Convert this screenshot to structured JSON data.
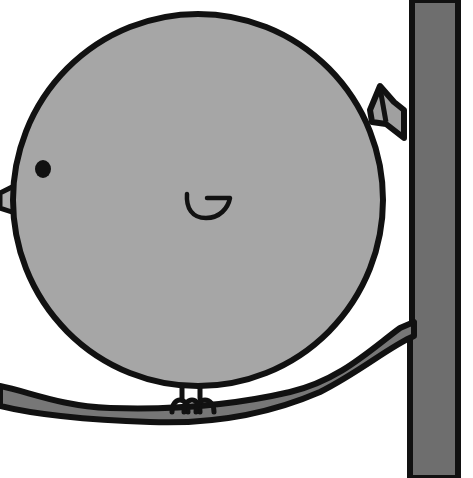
{
  "scene": {
    "description": "Cartoon round grey bird perched on a branch next to a tree trunk",
    "width": 473,
    "height": 478,
    "colors": {
      "background": "#ffffff",
      "bird_body": "#a6a6a6",
      "outline": "#111111",
      "trunk": "#6e6e6e",
      "branch": "#777777",
      "beak": "#b0b0b0",
      "tail": "#a0a0a0",
      "eye": "#111111"
    }
  },
  "elements": {
    "bird": {
      "label": "bird"
    },
    "eye": {
      "label": "eye"
    },
    "beak": {
      "label": "beak"
    },
    "wing": {
      "label": "wing"
    },
    "tail": {
      "label": "tail"
    },
    "feet": {
      "label": "feet"
    },
    "branch": {
      "label": "branch"
    },
    "trunk": {
      "label": "tree-trunk"
    }
  }
}
